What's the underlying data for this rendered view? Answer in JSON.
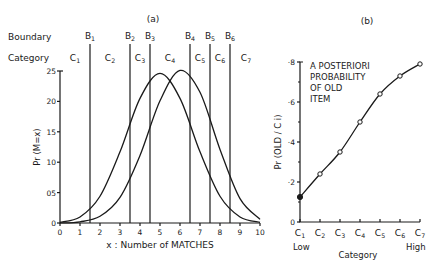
{
  "chart_data": [
    {
      "panel": "(a)",
      "type": "line",
      "title": "(a)",
      "xlabel": "x : Number of MATCHES",
      "ylabel": "Pr (M=x)",
      "xlim": [
        0,
        10
      ],
      "ylim": [
        0,
        0.25
      ],
      "xticks": [
        "0",
        "1",
        "2",
        "3",
        "4",
        "5",
        "6",
        "7",
        "8",
        "9",
        "10"
      ],
      "yticks": [
        {
          "value": 0,
          "label": "0"
        },
        {
          "value": 0.05,
          "label": "05"
        },
        {
          "value": 0.1,
          "label": "10"
        },
        {
          "value": 0.15,
          "label": "15"
        },
        {
          "value": 0.2,
          "label": "20"
        },
        {
          "value": 0.25,
          "label": "25"
        }
      ],
      "row_labels": {
        "boundary": "Boundary",
        "category": "Category"
      },
      "boundaries": [
        {
          "label": "B",
          "sub": "1",
          "x": 1.5
        },
        {
          "label": "B",
          "sub": "2",
          "x": 3.5
        },
        {
          "label": "B",
          "sub": "3",
          "x": 4.5
        },
        {
          "label": "B",
          "sub": "4",
          "x": 6.5
        },
        {
          "label": "B",
          "sub": "5",
          "x": 7.5
        },
        {
          "label": "B",
          "sub": "6",
          "x": 8.5
        }
      ],
      "categories": [
        {
          "label": "C",
          "sub": "1",
          "x": 0.75
        },
        {
          "label": "C",
          "sub": "2",
          "x": 2.5
        },
        {
          "label": "C",
          "sub": "3",
          "x": 4.0
        },
        {
          "label": "C",
          "sub": "4",
          "x": 5.5
        },
        {
          "label": "C",
          "sub": "5",
          "x": 7.0
        },
        {
          "label": "C",
          "sub": "6",
          "x": 8.0
        },
        {
          "label": "C",
          "sub": "7",
          "x": 9.3
        }
      ],
      "series": [
        {
          "name": "new-item distribution",
          "x": [
            0,
            1,
            2,
            3,
            4,
            5,
            6,
            7,
            8,
            9,
            10
          ],
          "values": [
            0.001,
            0.01,
            0.044,
            0.117,
            0.205,
            0.246,
            0.205,
            0.117,
            0.044,
            0.01,
            0.001
          ]
        },
        {
          "name": "old-item distribution",
          "x": [
            0,
            1,
            2,
            3,
            4,
            5,
            6,
            7,
            8,
            9,
            10
          ],
          "values": [
            0.0001,
            0.002,
            0.011,
            0.042,
            0.111,
            0.201,
            0.251,
            0.215,
            0.121,
            0.04,
            0.006
          ]
        }
      ],
      "grid": false,
      "legend": null
    },
    {
      "panel": "(b)",
      "type": "line",
      "title": "(b)",
      "xlabel": "Category",
      "ylabel": "Pr (OLD / C i)",
      "annotation": [
        "A POSTERIORI",
        "PROBABILITY",
        "OF OLD",
        "ITEM"
      ],
      "categories": [
        "C1",
        "C2",
        "C3",
        "C4",
        "C5",
        "C6",
        "C7"
      ],
      "x_end_labels": {
        "low": "Low",
        "high": "High"
      },
      "ylim": [
        0,
        0.8
      ],
      "yticks": [
        {
          "value": 0,
          "label": "0"
        },
        {
          "value": 0.2,
          "label": "·2"
        },
        {
          "value": 0.4,
          "label": "·4"
        },
        {
          "value": 0.6,
          "label": "·6"
        },
        {
          "value": 0.8,
          "label": "·8"
        }
      ],
      "values": [
        0.125,
        0.24,
        0.35,
        0.5,
        0.64,
        0.73,
        0.79
      ],
      "grid": false,
      "legend": null
    }
  ]
}
